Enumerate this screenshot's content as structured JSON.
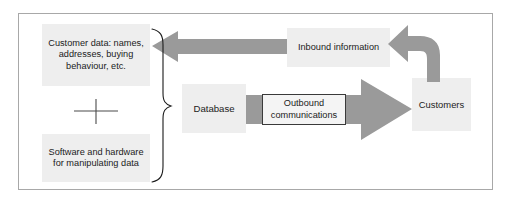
{
  "diagram": {
    "title_visible": false,
    "frame": {
      "border_color": "#a8a8a8"
    },
    "palette": {
      "arrow_gray": "#9a9a9a",
      "box_fill": "#eeeeee",
      "label_fill": "#f4f4f4",
      "label_border": "#3a3a3a",
      "text_color": "#1b1b1b",
      "brace_color": "#1b1b1b",
      "plus_color": "#4a4a4a"
    },
    "boxes": {
      "customer_data": "Customer data: names, addresses, buying behaviour, etc.",
      "software_hardware": "Software and hardware for manipulating data",
      "database": "Database",
      "inbound_information": "Inbound information",
      "customers": "Customers"
    },
    "labels": {
      "outbound_communications": "Outbound communications",
      "plus": "+"
    },
    "arrows": [
      {
        "name": "inbound-flow-arrow",
        "direction": "left",
        "color": "#9a9a9a"
      },
      {
        "name": "outbound-flow-arrow",
        "direction": "right",
        "color": "#9a9a9a"
      },
      {
        "name": "customer-feedback-curved-arrow",
        "direction": "up-left-curve",
        "color": "#9a9a9a"
      }
    ],
    "brace": {
      "name": "grouping-brace",
      "orientation": "right-facing"
    }
  }
}
